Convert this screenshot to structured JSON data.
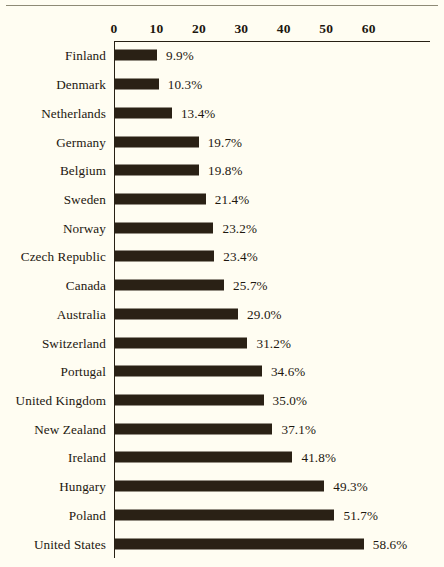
{
  "figure": {
    "background_color": "#fffdf2",
    "bar_color": "#2a2115",
    "axis_color": "#272014",
    "text_color": "#1d170f"
  },
  "chart_data": {
    "type": "bar",
    "orientation": "horizontal",
    "title": "",
    "subtitle": "",
    "xlabel": "",
    "ylabel": "",
    "xlim": [
      0,
      60
    ],
    "xticks": [
      0,
      10,
      20,
      30,
      40,
      50,
      60
    ],
    "xtick_labels": [
      "0",
      "10",
      "20",
      "30",
      "40",
      "50",
      "60"
    ],
    "grid": false,
    "legend": false,
    "value_label_suffix": "%",
    "categories": [
      "Finland",
      "Denmark",
      "Netherlands",
      "Germany",
      "Belgium",
      "Sweden",
      "Norway",
      "Czech Republic",
      "Canada",
      "Australia",
      "Switzerland",
      "Portugal",
      "United Kingdom",
      "New Zealand",
      "Ireland",
      "Hungary",
      "Poland",
      "United States"
    ],
    "values": [
      9.9,
      10.3,
      13.4,
      19.7,
      19.8,
      21.4,
      23.2,
      23.4,
      25.7,
      29.0,
      31.2,
      34.6,
      35.0,
      37.1,
      41.8,
      49.3,
      51.7,
      58.6
    ],
    "value_labels": [
      "9.9%",
      "10.3%",
      "13.4%",
      "19.7%",
      "19.8%",
      "21.4%",
      "23.2%",
      "23.4%",
      "25.7%",
      "29.0%",
      "31.2%",
      "34.6%",
      "35.0%",
      "37.1%",
      "41.8%",
      "49.3%",
      "51.7%",
      "58.6%"
    ]
  }
}
